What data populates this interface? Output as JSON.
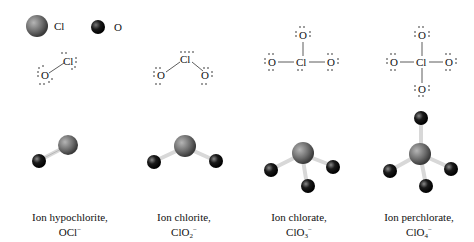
{
  "legend": {
    "items": [
      {
        "symbol": "Cl",
        "label": "Cl",
        "color": "#6e6e6e"
      },
      {
        "symbol": "O",
        "label": "O",
        "color": "#1a1a1a"
      }
    ]
  },
  "lewis": {
    "atom_cl": "Cl",
    "atom_o": "O"
  },
  "ions": [
    {
      "name": "Ion hypochlorite,",
      "formula_main": "OCl",
      "formula_sub": "",
      "charge": "−"
    },
    {
      "name": "Ion chlorite,",
      "formula_main": "ClO",
      "formula_sub": "2",
      "charge": "−"
    },
    {
      "name": "Ion chlorate,",
      "formula_main": "ClO",
      "formula_sub": "3",
      "charge": "−"
    },
    {
      "name": "Ion perchlorate,",
      "formula_main": "ClO",
      "formula_sub": "4",
      "charge": "−"
    }
  ],
  "colors": {
    "chlorine": "#6e6e6e",
    "oxygen": "#1a1a1a",
    "bond": "#d8d8d8"
  }
}
